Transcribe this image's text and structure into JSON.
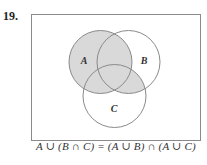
{
  "problem": {
    "number": "19."
  },
  "venn": {
    "sets": [
      {
        "label": "A",
        "cx": 100.5,
        "cy": 62,
        "r": 31.5,
        "label_x": 84,
        "label_y": 64
      },
      {
        "label": "B",
        "cx": 128.5,
        "cy": 62,
        "r": 31.5,
        "label_x": 144,
        "label_y": 64
      },
      {
        "label": "C",
        "cx": 114.5,
        "cy": 96,
        "r": 31.5,
        "label_x": 114,
        "label_y": 112
      }
    ],
    "shaded_region": "A ∪ (B ∩ C)",
    "colors": {
      "shade": "#d9d9d9",
      "stroke": "#8a8a8a",
      "box": "#8a8a8a"
    }
  },
  "caption": {
    "equation": "A ∪ (B ∩ C) = (A ∪ B) ∩ (A ∪ C)"
  }
}
